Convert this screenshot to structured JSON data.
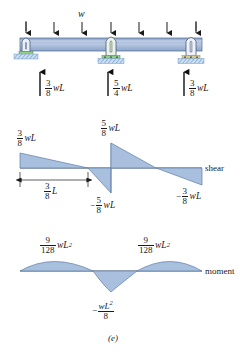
{
  "figure": {
    "caption": "(e)",
    "distributed_load_label": "w",
    "beam": {
      "supports": 3,
      "support_type": "pin-roller",
      "span_count": 2
    },
    "reactions": [
      {
        "name": "left-reaction",
        "num": "3",
        "den": "8",
        "unit": "wL",
        "direction": "up"
      },
      {
        "name": "center-reaction",
        "num": "5",
        "den": "4",
        "unit": "wL",
        "direction": "up"
      },
      {
        "name": "right-reaction",
        "num": "3",
        "den": "8",
        "unit": "wL",
        "direction": "up"
      }
    ],
    "shear_diagram": {
      "axis_label": "shear",
      "labels": [
        {
          "name": "shear-left-max",
          "sign": "",
          "num": "3",
          "den": "8",
          "unit": "wL"
        },
        {
          "name": "shear-center-pos",
          "sign": "",
          "num": "5",
          "den": "8",
          "unit": "wL"
        },
        {
          "name": "shear-center-neg",
          "sign": "−",
          "num": "5",
          "den": "8",
          "unit": "wL"
        },
        {
          "name": "shear-right-neg",
          "sign": "−",
          "num": "3",
          "den": "8",
          "unit": "wL"
        }
      ],
      "dimension": {
        "name": "zero-shear-distance",
        "num": "3",
        "den": "8",
        "unit": "L"
      }
    },
    "moment_diagram": {
      "axis_label": "moment",
      "labels": [
        {
          "name": "moment-left-max",
          "sign": "",
          "num": "9",
          "den": "128",
          "unit": "wL",
          "power": "2"
        },
        {
          "name": "moment-right-max",
          "sign": "",
          "num": "9",
          "den": "128",
          "unit": "wL",
          "power": "2"
        },
        {
          "name": "moment-center-min",
          "sign": "−",
          "num": "wL",
          "den": "8",
          "unit": "",
          "power": "2"
        }
      ]
    },
    "colors": {
      "beam_fill": "#9fb4d8",
      "diagram_fill": "#a8c0de",
      "outline": "#3a4a63",
      "support_green": "#9ad18e",
      "hatch_blue": "#7fa8d4",
      "ink": "#1a1a1a"
    }
  }
}
